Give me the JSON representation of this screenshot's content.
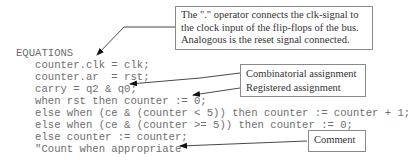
{
  "code": {
    "lines": [
      "EQUATIONS",
      "   counter.clk = clk;",
      "   counter.ar  = rst;",
      "   carry = q2 & q0;",
      "   when rst then counter := 0;",
      "   else when (ce & (counter < 5)) then counter := counter + 1;",
      "   else when (ce & (counter >= 5)) then counter := 0;",
      "   else counter := counter;",
      "   \"Count when appropriate"
    ]
  },
  "annotations": {
    "operator_note": {
      "lines": [
        "The \".\" operator connects the clk-signal to",
        "the clock input of the flip-flops of the bus.",
        "Analogous is the reset signal connected."
      ]
    },
    "assignment_note": {
      "combinatorial": "Combinatorial assignment",
      "registered": "Registered assignment"
    },
    "comment_note": {
      "label": "Comment"
    }
  }
}
